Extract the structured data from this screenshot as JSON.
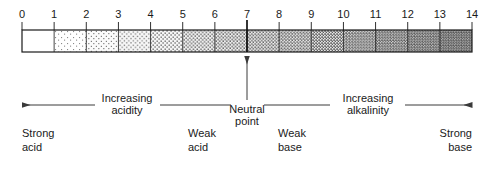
{
  "diagram": {
    "scale": {
      "name": "ph-scale-bar",
      "min": 0,
      "max": 14,
      "tick_labels": [
        "0",
        "1",
        "2",
        "3",
        "4",
        "5",
        "6",
        "7",
        "8",
        "9",
        "10",
        "11",
        "12",
        "13",
        "14"
      ],
      "neutral_value": "7",
      "unshaded_segments": [
        "0-1"
      ],
      "shading": "stipple, density increases from pH 1 to pH 14",
      "border_color": "#1a1a1a",
      "fill_color": "#d8d8d8"
    },
    "annotations": {
      "left_arrow": {
        "label_line1": "Increasing",
        "label_line2": "acidity",
        "direction": "left"
      },
      "right_arrow": {
        "label_line1": "Increasing",
        "label_line2": "alkalinity",
        "direction": "right"
      },
      "neutral": {
        "label_line1": "Neutral",
        "label_line2": "point",
        "direction": "up",
        "points_to": "7"
      }
    },
    "zones": [
      {
        "name": "strong-acid",
        "label_line1": "Strong",
        "label_line2": "acid"
      },
      {
        "name": "weak-acid",
        "label_line1": "Weak",
        "label_line2": "acid"
      },
      {
        "name": "weak-base",
        "label_line1": "Weak",
        "label_line2": "base"
      },
      {
        "name": "strong-base",
        "label_line1": "Strong",
        "label_line2": "base"
      }
    ]
  }
}
